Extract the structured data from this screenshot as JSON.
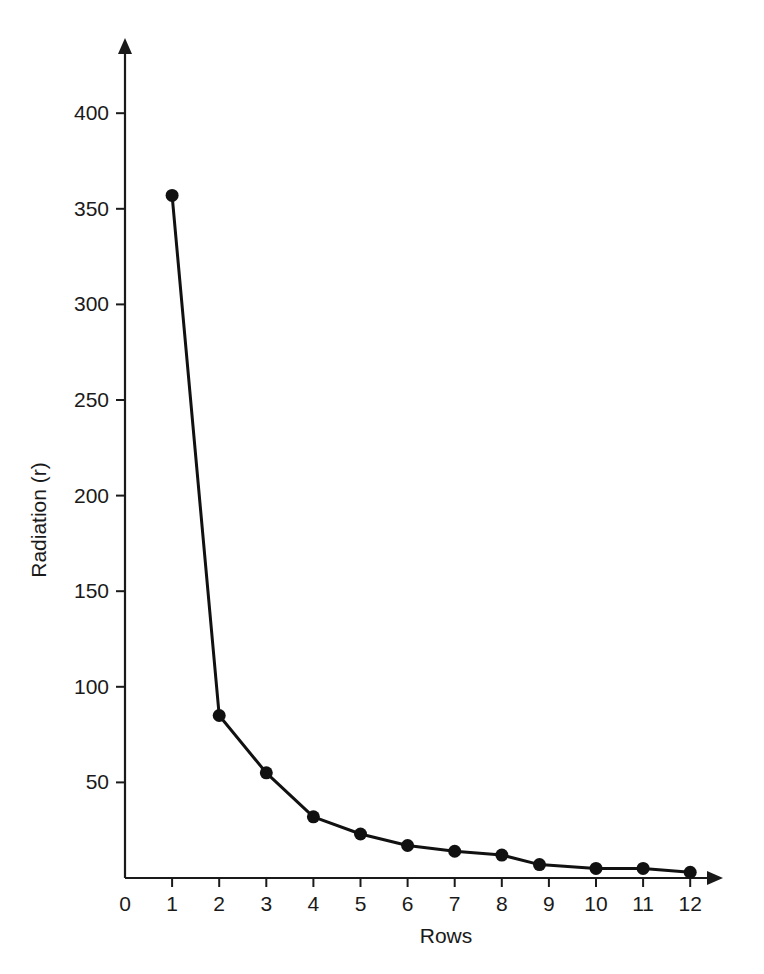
{
  "chart_data": {
    "type": "line",
    "title": "",
    "subtitle": "",
    "xlabel": "Rows",
    "ylabel": "Radiation (r)",
    "x": [
      1,
      2,
      3,
      4,
      5,
      6,
      7,
      8,
      8.8,
      10,
      11,
      12
    ],
    "values": [
      357,
      85,
      55,
      32,
      23,
      17,
      14,
      12,
      7,
      5,
      5,
      3
    ],
    "series": [
      {
        "name": "Radiation",
        "x": [
          1,
          2,
          3,
          4,
          5,
          6,
          7,
          8,
          8.8,
          10,
          11,
          12
        ],
        "values": [
          357,
          85,
          55,
          32,
          23,
          17,
          14,
          12,
          7,
          5,
          5,
          3
        ]
      }
    ],
    "xlim": [
      0,
      12.7
    ],
    "ylim": [
      0,
      430
    ],
    "xticks": [
      0,
      1,
      2,
      3,
      4,
      5,
      6,
      7,
      8,
      9,
      10,
      11,
      12
    ],
    "xtick_labels": [
      "0",
      "1",
      "2",
      "3",
      "4",
      "5",
      "6",
      "7",
      "8",
      "9",
      "10",
      "11",
      "12"
    ],
    "yticks": [
      50,
      100,
      150,
      200,
      250,
      300,
      350,
      400
    ],
    "ytick_labels": [
      "50",
      "100",
      "150",
      "200",
      "250",
      "300",
      "350",
      "400"
    ],
    "grid": false,
    "legend": false,
    "legend_position": "none",
    "marker": "filled-circle",
    "line_color": "#111111",
    "marker_color": "#111111",
    "axis_color": "#1a1a1a",
    "background_color": "#ffffff",
    "x_axis_arrow": true,
    "y_axis_arrow": true,
    "annotations": []
  }
}
